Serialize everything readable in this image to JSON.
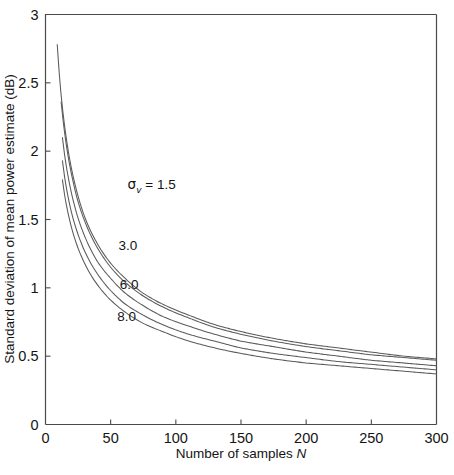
{
  "chart_data": {
    "type": "line",
    "title": "",
    "xlabel": "Number of samples  N",
    "xlabel_plain": "Number of samples",
    "xlabel_symbol": "N",
    "ylabel": "Standard deviation of mean power estimate (dB)",
    "xlim": [
      0,
      300
    ],
    "ylim": [
      0,
      3
    ],
    "xticks": [
      0,
      50,
      100,
      150,
      200,
      250,
      300
    ],
    "xticklabels": [
      "0",
      "50",
      "100",
      "150",
      "200",
      "250",
      "300"
    ],
    "yticks": [
      0,
      0.5,
      1,
      1.5,
      2,
      2.5,
      3
    ],
    "yticklabels": [
      "0",
      "0.5",
      "1",
      "1.5",
      "2",
      "2.5",
      "3"
    ],
    "grid": false,
    "legend_position": "inline-annotations",
    "annotations": [
      {
        "name": "sigma-v-1p5",
        "symbol": "σ",
        "subscript": "v",
        "equals": " = ",
        "value": "1.5",
        "x": 63,
        "y": 1.72
      },
      {
        "name": "sigma-3p0",
        "text": "3.0",
        "x": 56,
        "y": 1.28
      },
      {
        "name": "sigma-6p0",
        "text": "6.0",
        "x": 57,
        "y": 0.99
      },
      {
        "name": "sigma-8p0",
        "text": "8.0",
        "x": 55,
        "y": 0.76
      }
    ],
    "series": [
      {
        "name": "sigma_v = 1.5",
        "label": "1.5",
        "k": 8.35,
        "x": [
          9,
          12,
          15,
          20,
          25,
          30,
          40,
          50,
          60,
          75,
          90,
          110,
          130,
          150,
          175,
          200,
          225,
          250,
          275,
          300
        ],
        "y": [
          2.78,
          2.41,
          2.16,
          1.87,
          1.67,
          1.52,
          1.32,
          1.18,
          1.08,
          0.96,
          0.88,
          0.8,
          0.73,
          0.68,
          0.63,
          0.59,
          0.56,
          0.53,
          0.5,
          0.48
        ]
      },
      {
        "name": "sigma_v = 3.0",
        "label": "3.0",
        "k": 7.05,
        "x": [
          12,
          15,
          20,
          25,
          30,
          40,
          50,
          60,
          75,
          90,
          110,
          130,
          150,
          175,
          200,
          225,
          250,
          275,
          300
        ],
        "y": [
          2.36,
          2.11,
          1.83,
          1.63,
          1.49,
          1.29,
          1.15,
          1.05,
          0.94,
          0.86,
          0.78,
          0.71,
          0.66,
          0.61,
          0.57,
          0.54,
          0.51,
          0.49,
          0.47
        ]
      },
      {
        "name": "sigma_v = 6.0",
        "label": "6.0",
        "k": 6.05,
        "x": [
          13,
          15,
          20,
          25,
          30,
          40,
          50,
          60,
          75,
          90,
          110,
          130,
          150,
          175,
          200,
          225,
          250,
          275,
          300
        ],
        "y": [
          2.1,
          1.95,
          1.69,
          1.51,
          1.38,
          1.19,
          1.07,
          0.97,
          0.87,
          0.79,
          0.72,
          0.66,
          0.61,
          0.57,
          0.53,
          0.5,
          0.47,
          0.45,
          0.43
        ]
      },
      {
        "name": "sigma_v = 8.0",
        "label": "8.0",
        "k": 5.55,
        "x": [
          13,
          15,
          20,
          25,
          30,
          40,
          50,
          60,
          75,
          90,
          110,
          130,
          150,
          175,
          200,
          225,
          250,
          275,
          300
        ],
        "y": [
          1.93,
          1.79,
          1.55,
          1.39,
          1.27,
          1.1,
          0.98,
          0.89,
          0.8,
          0.73,
          0.66,
          0.61,
          0.56,
          0.52,
          0.49,
          0.46,
          0.44,
          0.42,
          0.4
        ]
      },
      {
        "name": "lowest-curve",
        "label": "",
        "k": 5.15,
        "x": [
          13,
          15,
          20,
          25,
          30,
          40,
          50,
          60,
          75,
          90,
          110,
          130,
          150,
          175,
          200,
          225,
          250,
          275,
          300
        ],
        "y": [
          1.79,
          1.66,
          1.44,
          1.29,
          1.18,
          1.02,
          0.91,
          0.83,
          0.74,
          0.68,
          0.61,
          0.56,
          0.52,
          0.48,
          0.45,
          0.43,
          0.41,
          0.39,
          0.37
        ]
      }
    ],
    "colors": {
      "curve": "#5a5a5a",
      "axis": "#4a4a4a",
      "text": "#141414",
      "background": "#ffffff"
    }
  }
}
